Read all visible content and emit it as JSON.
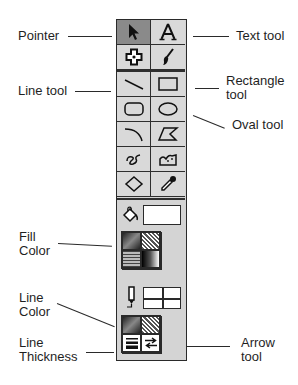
{
  "diagram": {
    "callouts": {
      "pointer": "Pointer",
      "text_tool": "Text tool",
      "line_tool": "Line tool",
      "rectangle_tool": "Rectangle\ntool",
      "oval_tool": "Oval tool",
      "fill_color": "Fill\nColor",
      "line_color": "Line\nColor",
      "line_thickness": "Line\nThickness",
      "arrow_tool": "Arrow\ntool"
    },
    "tools": [
      {
        "name": "pointer",
        "icon": "arrow-cursor-icon",
        "selected": true
      },
      {
        "name": "text",
        "icon": "letter-a-icon",
        "selected": false
      },
      {
        "name": "hand",
        "icon": "hand-cross-icon",
        "selected": false
      },
      {
        "name": "paintbrush",
        "icon": "brush-icon",
        "selected": false
      },
      {
        "name": "line",
        "icon": "line-icon",
        "selected": false
      },
      {
        "name": "rectangle",
        "icon": "rectangle-icon",
        "selected": false
      },
      {
        "name": "rounded-rectangle",
        "icon": "rounded-rect-icon",
        "selected": false
      },
      {
        "name": "oval",
        "icon": "oval-icon",
        "selected": false
      },
      {
        "name": "arc",
        "icon": "arc-icon",
        "selected": false
      },
      {
        "name": "polygon",
        "icon": "polygon-icon",
        "selected": false
      },
      {
        "name": "freehand",
        "icon": "squiggle-icon",
        "selected": false
      },
      {
        "name": "freeform-polygon",
        "icon": "freeform-icon",
        "selected": false
      },
      {
        "name": "diamond",
        "icon": "diamond-icon",
        "selected": false
      },
      {
        "name": "eyedropper",
        "icon": "eyedropper-icon",
        "selected": false
      }
    ],
    "colors": {
      "toolbar_bg": "#d4d4d4",
      "selected_bg": "#8a8a8a",
      "border": "#2a2a2a"
    }
  }
}
